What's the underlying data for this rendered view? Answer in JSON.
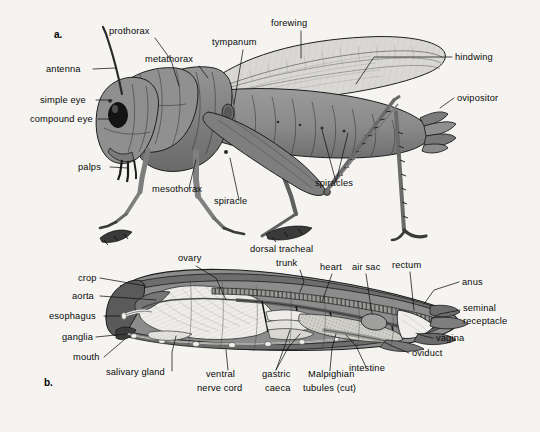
{
  "figure": {
    "background_color": "#f5f4f1",
    "body_gray": "#8a8a8a",
    "body_gray_dark": "#6e6e6e",
    "body_gray_darker": "#565656",
    "wing_light": "#d9d8d4",
    "organ_white": "#ececea",
    "ink": "#1b1b1b"
  },
  "panels": [
    {
      "id": "a",
      "letter": "a.",
      "caption": "External anatomy of a grasshopper"
    },
    {
      "id": "b",
      "letter": "b.",
      "caption": "Internal anatomy of a grasshopper"
    }
  ],
  "panel_a": {
    "labels": [
      {
        "text": "prothorax",
        "x": 109,
        "y": 34,
        "anchor": "start"
      },
      {
        "text": "forewing",
        "x": 271,
        "y": 26,
        "anchor": "start"
      },
      {
        "text": "metathorax",
        "x": 145,
        "y": 62,
        "anchor": "start"
      },
      {
        "text": "tympanum",
        "x": 212,
        "y": 45,
        "anchor": "start"
      },
      {
        "text": "antenna",
        "x": 46,
        "y": 72,
        "anchor": "start"
      },
      {
        "text": "hindwing",
        "x": 455,
        "y": 60,
        "anchor": "start"
      },
      {
        "text": "simple eye",
        "x": 40,
        "y": 103,
        "anchor": "start"
      },
      {
        "text": "ovipositor",
        "x": 457,
        "y": 101,
        "anchor": "start"
      },
      {
        "text": "compound eye",
        "x": 30,
        "y": 122,
        "anchor": "start"
      },
      {
        "text": "palps",
        "x": 78,
        "y": 170,
        "anchor": "start"
      },
      {
        "text": "mesothorax",
        "x": 152,
        "y": 192,
        "anchor": "start"
      },
      {
        "text": "spiracle",
        "x": 214,
        "y": 204,
        "anchor": "start"
      },
      {
        "text": "spiracles",
        "x": 315,
        "y": 186,
        "anchor": "start"
      }
    ]
  },
  "panel_b": {
    "labels": [
      {
        "text": "ovary",
        "x": 178,
        "y": 261,
        "anchor": "start"
      },
      {
        "text": "dorsal tracheal",
        "x": 250,
        "y": 252,
        "anchor": "start"
      },
      {
        "text": "trunk",
        "x": 276,
        "y": 266,
        "anchor": "start"
      },
      {
        "text": "heart",
        "x": 320,
        "y": 270,
        "anchor": "start"
      },
      {
        "text": "air sac",
        "x": 352,
        "y": 270,
        "anchor": "start"
      },
      {
        "text": "rectum",
        "x": 392,
        "y": 268,
        "anchor": "start"
      },
      {
        "text": "anus",
        "x": 462,
        "y": 285,
        "anchor": "start"
      },
      {
        "text": "crop",
        "x": 78,
        "y": 281,
        "anchor": "start"
      },
      {
        "text": "aorta",
        "x": 72,
        "y": 299,
        "anchor": "start"
      },
      {
        "text": "esophagus",
        "x": 49,
        "y": 319,
        "anchor": "start"
      },
      {
        "text": "seminal",
        "x": 463,
        "y": 311,
        "anchor": "start"
      },
      {
        "text": "receptacle",
        "x": 463,
        "y": 324,
        "anchor": "start"
      },
      {
        "text": "ganglia",
        "x": 62,
        "y": 340,
        "anchor": "start"
      },
      {
        "text": "vagina",
        "x": 436,
        "y": 341,
        "anchor": "start"
      },
      {
        "text": "oviduct",
        "x": 412,
        "y": 356,
        "anchor": "start"
      },
      {
        "text": "mouth",
        "x": 73,
        "y": 360,
        "anchor": "start"
      },
      {
        "text": "salivary gland",
        "x": 106,
        "y": 375,
        "anchor": "start"
      },
      {
        "text": "intestine",
        "x": 349,
        "y": 371,
        "anchor": "start"
      },
      {
        "text": "ventral",
        "x": 206,
        "y": 377,
        "anchor": "start"
      },
      {
        "text": "gastric",
        "x": 262,
        "y": 377,
        "anchor": "start"
      },
      {
        "text": "Malpighian",
        "x": 308,
        "y": 377,
        "anchor": "start"
      },
      {
        "text": "nerve cord",
        "x": 197,
        "y": 391,
        "anchor": "start"
      },
      {
        "text": "caeca",
        "x": 265,
        "y": 391,
        "anchor": "start"
      },
      {
        "text": "tubules (cut)",
        "x": 303,
        "y": 391,
        "anchor": "start"
      }
    ]
  }
}
